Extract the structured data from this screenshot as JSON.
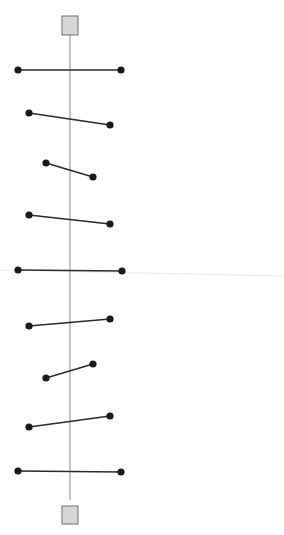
{
  "canvas": {
    "width": 284,
    "height": 535,
    "background": "#ffffff"
  },
  "colors": {
    "axis": "#8a8a8a",
    "segment": "#2a2a2a",
    "dot": "#1a1a1a",
    "terminal_fill": "#d6d6d6",
    "terminal_stroke": "#6e6e6e",
    "faint_guide": "#ececec"
  },
  "axis": {
    "x": 70,
    "y_top": 35,
    "y_bottom": 500
  },
  "terminals": [
    {
      "id": "top",
      "x": 62,
      "y": 16,
      "w": 16,
      "h": 19
    },
    {
      "id": "bottom",
      "x": 62,
      "y": 506,
      "w": 16,
      "h": 18
    }
  ],
  "faint_guide": {
    "x1": 0,
    "y1": 270,
    "x2": 284,
    "y2": 276
  },
  "segments": [
    {
      "x1": 18,
      "y1": 70,
      "x2": 121,
      "y2": 70
    },
    {
      "x1": 29,
      "y1": 113,
      "x2": 110,
      "y2": 125
    },
    {
      "x1": 46,
      "y1": 163,
      "x2": 93,
      "y2": 177
    },
    {
      "x1": 29,
      "y1": 215,
      "x2": 110,
      "y2": 224
    },
    {
      "x1": 18,
      "y1": 270,
      "x2": 122,
      "y2": 271
    },
    {
      "x1": 29,
      "y1": 326,
      "x2": 110,
      "y2": 319
    },
    {
      "x1": 46,
      "y1": 378,
      "x2": 93,
      "y2": 364
    },
    {
      "x1": 29,
      "y1": 427,
      "x2": 110,
      "y2": 416
    },
    {
      "x1": 18,
      "y1": 471,
      "x2": 121,
      "y2": 472
    }
  ],
  "dot_radius": 3.6
}
